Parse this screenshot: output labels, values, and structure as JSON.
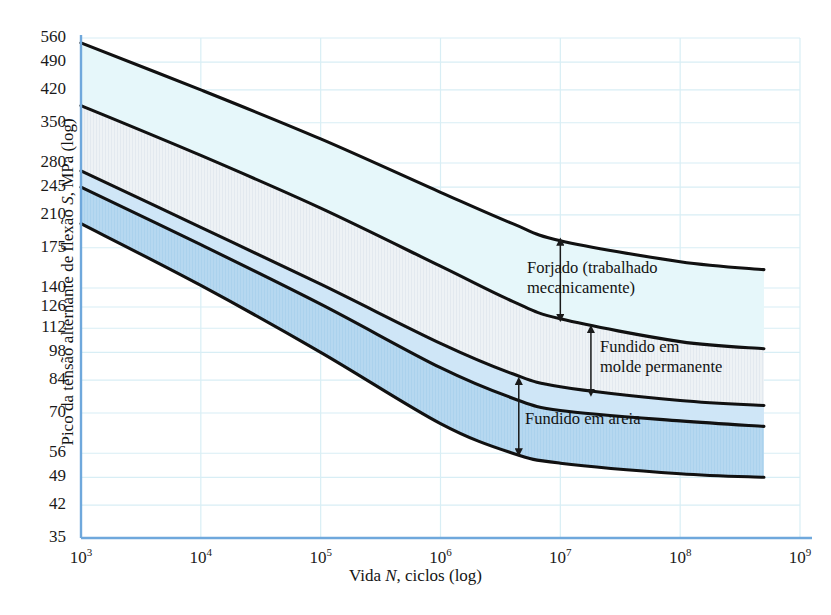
{
  "figure": {
    "kind": "fatigue-sn-band-chart",
    "background": "#ffffff",
    "axis_color": "#6fa8dc",
    "grid_color": "#d8eef5",
    "curve_color": "#111111"
  },
  "axes": {
    "y": {
      "title": "Pico da tensão alternante de flexão S, MPa (log)",
      "title_italic_token": "S",
      "scale": "log",
      "min": 35,
      "max": 560,
      "ticks": [
        560,
        490,
        420,
        350,
        280,
        245,
        210,
        175,
        140,
        126,
        112,
        98,
        84,
        70,
        56,
        49,
        42,
        35
      ],
      "tick_labels": [
        "560",
        "490",
        "420",
        "350",
        "280",
        "245",
        "210",
        "175",
        "140",
        "126",
        "112",
        "98",
        "84",
        "70",
        "56",
        "49",
        "42",
        "35"
      ]
    },
    "x": {
      "title": "Vida N, ciclos (log)",
      "title_italic_token": "N",
      "scale": "log",
      "min": 1000,
      "max": 1000000000,
      "ticks": [
        1000,
        10000,
        100000,
        1000000,
        10000000,
        100000000,
        1000000000
      ],
      "tick_labels": [
        "103",
        "104",
        "105",
        "106",
        "107",
        "108",
        "109"
      ],
      "tick_mantissa": "10",
      "tick_exponents": [
        "3",
        "4",
        "5",
        "6",
        "7",
        "8",
        "9"
      ]
    }
  },
  "annotations": [
    {
      "id": "forjado",
      "text": "Forjado (trabalhado\nmecanicamente)",
      "band": "wrought"
    },
    {
      "id": "molde",
      "text": "Fundido em\nmolde permanente",
      "band": "permanent-mold"
    },
    {
      "id": "areia",
      "text": "Fundido em areia",
      "band": "sand-cast"
    }
  ],
  "chart_data": {
    "type": "area",
    "title": "",
    "xlabel": "Vida N, ciclos (log)",
    "ylabel": "Pico da tensão alternante de flexão S, MPa (log)",
    "xscale": "log",
    "yscale": "log",
    "xlim": [
      1000,
      1000000000
    ],
    "ylim": [
      35,
      560
    ],
    "grid": true,
    "legend": "inline-annotations",
    "x": [
      1000,
      10000,
      100000,
      1000000,
      4000000,
      10000000,
      100000000,
      500000000
    ],
    "series": [
      {
        "name": "Forjado - limite superior",
        "role": "wrought-upper",
        "values": [
          545,
          420,
          320,
          238,
          200,
          182,
          162,
          155
        ]
      },
      {
        "name": "Forjado - limite inferior",
        "role": "wrought-lower",
        "values": [
          385,
          292,
          218,
          158,
          130,
          118,
          104,
          100
        ]
      },
      {
        "name": "Fundido em molde permanente - limite inferior",
        "role": "permanent-mold-lower",
        "values": [
          268,
          196,
          143,
          103,
          87,
          81,
          75,
          73
        ]
      },
      {
        "name": "Fundido em areia - limite superior",
        "role": "sand-cast-upper",
        "values": [
          245,
          178,
          128,
          90,
          76,
          71,
          67,
          65
        ]
      },
      {
        "name": "Fundido em areia - limite inferior",
        "role": "sand-cast-lower",
        "values": [
          200,
          142,
          98,
          66,
          56,
          53,
          50,
          49
        ]
      }
    ],
    "bands": [
      {
        "name": "Forjado (trabalhado mecanicamente)",
        "upper": "wrought-upper",
        "lower": "wrought-lower",
        "fill": "#e6f7fa"
      },
      {
        "name": "Fundido em molde permanente",
        "upper": "wrought-lower",
        "lower": "permanent-mold-lower",
        "fill": "#eef1f4"
      },
      {
        "name": "Fundido em areia",
        "upper": "sand-cast-upper",
        "lower": "sand-cast-lower",
        "fill": "#b6d8f0"
      }
    ],
    "arrows": [
      {
        "for": "Forjado (trabalhado mecanicamente)",
        "x": 10000000,
        "from": 182,
        "to": 118,
        "double_headed": true
      },
      {
        "for": "Fundido em molde permanente",
        "x": 18000000,
        "from": 112,
        "to": 78,
        "double_headed": true
      },
      {
        "for": "Fundido em areia",
        "x": 4500000,
        "from": 84,
        "to": 56,
        "double_headed": true
      }
    ]
  }
}
